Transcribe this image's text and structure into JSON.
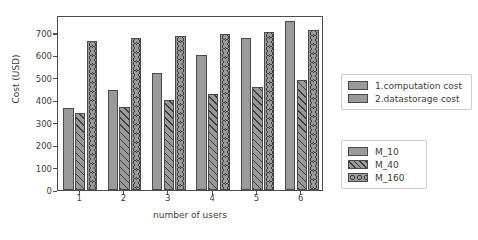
{
  "chart_data": {
    "type": "bar",
    "title": "",
    "xlabel": "number of users",
    "ylabel": "Cost (USD)",
    "categories": [
      "1",
      "2",
      "3",
      "4",
      "5",
      "6"
    ],
    "ylim": [
      0,
      780
    ],
    "yticks": [
      0,
      100,
      200,
      300,
      400,
      500,
      600,
      700
    ],
    "ytick_labels": [
      "0",
      "100",
      "200",
      "300",
      "400",
      "500",
      "600",
      "700"
    ],
    "grid": false,
    "legend_position": "right",
    "series": [
      {
        "name": "M_10",
        "pattern": "solid",
        "values": [
          365,
          445,
          522,
          600,
          678,
          755
        ]
      },
      {
        "name": "M_40",
        "pattern": "diagonal",
        "values": [
          342,
          372,
          402,
          430,
          460,
          490
        ]
      },
      {
        "name": "M_160",
        "pattern": "circles",
        "values": [
          665,
          677,
          687,
          697,
          705,
          713
        ]
      }
    ],
    "legends": [
      {
        "name": "cost-type-legend",
        "entries": [
          {
            "label": "1.computation cost",
            "pattern": "solid"
          },
          {
            "label": "2.datastorage cost",
            "pattern": "solid"
          }
        ]
      },
      {
        "name": "series-legend",
        "entries": [
          {
            "label": "M_10",
            "pattern": "solid"
          },
          {
            "label": "M_40",
            "pattern": "diagonal"
          },
          {
            "label": "M_160",
            "pattern": "circles"
          }
        ]
      }
    ],
    "colors": {
      "bar_fill": "#9a9a9a",
      "bar_edge": "#4a4a4a",
      "hatch": "#3c3c3c",
      "axis": "#4d4d4d",
      "text": "#3c3c3c",
      "background": "#ffffff"
    }
  }
}
